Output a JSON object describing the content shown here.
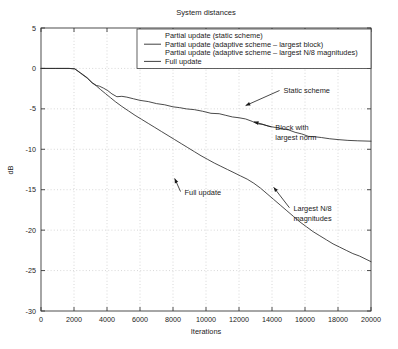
{
  "chart_data": {
    "type": "line",
    "title": "System distances",
    "xlabel": "Iterations",
    "ylabel": "dB",
    "xlim": [
      0,
      20000
    ],
    "ylim": [
      -30,
      5
    ],
    "xticks": [
      0,
      2000,
      4000,
      6000,
      8000,
      10000,
      12000,
      14000,
      16000,
      18000,
      20000
    ],
    "xtick_labels": [
      "0",
      "2000",
      "4000",
      "6000",
      "8000",
      "10000",
      "12000",
      "14000",
      "16000",
      "18000",
      "20000"
    ],
    "yticks": [
      5,
      0,
      -5,
      -10,
      -15,
      -20,
      -25,
      -30
    ],
    "ytick_labels": [
      "5",
      "0",
      "-5",
      "-10",
      "-15",
      "-20",
      "-25",
      "-30"
    ],
    "grid": true,
    "legend_position": "top-center",
    "legend": [
      "Partial update (static scheme)",
      "Partial update (adaptive scheme – largest block)",
      "Partial update (adaptive scheme – largest N/8 magnitudes)",
      "Full update"
    ],
    "annotations": [
      {
        "text": "Static scheme",
        "text_x": 14700,
        "text_y": -3.1,
        "tip_x": 12400,
        "tip_y": -4.6
      },
      {
        "text": "Block with",
        "text_x": 14200,
        "text_y": -7.6,
        "tip_x": 12900,
        "tip_y": -6.6
      },
      {
        "text": "largest norm",
        "text_x": 14200,
        "text_y": -8.9,
        "tip_x": null,
        "tip_y": null
      },
      {
        "text": "Full update",
        "text_x": 8700,
        "text_y": -15.6,
        "tip_x": 8100,
        "tip_y": -13.6
      },
      {
        "text": "Largest N/8",
        "text_x": 15300,
        "text_y": -17.6,
        "tip_x": 14100,
        "tip_y": -14.7
      },
      {
        "text": "magnitudes",
        "text_x": 15300,
        "text_y": -18.9,
        "tip_x": null,
        "tip_y": null
      }
    ],
    "series": [
      {
        "name": "Partial update (static scheme)",
        "points": [
          [
            0,
            0.0
          ],
          [
            900,
            0.0
          ],
          [
            1700,
            0.0
          ],
          [
            2050,
            -0.05
          ],
          [
            2400,
            -0.55
          ],
          [
            2800,
            -1.15
          ],
          [
            3100,
            -1.75
          ],
          [
            3350,
            -2.1
          ],
          [
            3550,
            -2.2
          ],
          [
            3800,
            -2.45
          ],
          [
            4050,
            -2.75
          ],
          [
            4300,
            -3.15
          ],
          [
            4600,
            -3.5
          ],
          [
            4900,
            -3.45
          ],
          [
            5200,
            -3.55
          ],
          [
            5600,
            -3.75
          ],
          [
            6000,
            -3.95
          ],
          [
            6500,
            -4.1
          ],
          [
            7000,
            -4.35
          ],
          [
            7500,
            -4.5
          ],
          [
            8000,
            -4.75
          ],
          [
            8400,
            -4.85
          ],
          [
            8800,
            -5.0
          ],
          [
            9300,
            -5.1
          ],
          [
            9800,
            -5.3
          ],
          [
            10300,
            -5.55
          ],
          [
            10800,
            -5.6
          ],
          [
            11200,
            -5.8
          ],
          [
            11600,
            -6.0
          ],
          [
            12000,
            -6.1
          ],
          [
            12400,
            -6.25
          ],
          [
            12800,
            -6.55
          ],
          [
            13100,
            -6.85
          ],
          [
            13400,
            -6.9
          ],
          [
            13800,
            -7.15
          ],
          [
            14200,
            -7.3
          ],
          [
            14600,
            -7.45
          ],
          [
            15000,
            -7.6
          ],
          [
            15400,
            -7.9
          ],
          [
            15800,
            -8.1
          ],
          [
            16200,
            -8.4
          ],
          [
            16600,
            -8.45
          ],
          [
            17000,
            -8.55
          ],
          [
            17500,
            -8.7
          ],
          [
            18000,
            -8.8
          ],
          [
            18600,
            -8.9
          ],
          [
            19200,
            -8.95
          ],
          [
            20000,
            -9.0
          ]
        ]
      },
      {
        "name": "Full update / largest N/8 magnitudes",
        "points": [
          [
            0,
            0.0
          ],
          [
            900,
            0.0
          ],
          [
            1700,
            0.0
          ],
          [
            2050,
            -0.05
          ],
          [
            2400,
            -0.6
          ],
          [
            2800,
            -1.2
          ],
          [
            3100,
            -1.8
          ],
          [
            3350,
            -2.15
          ],
          [
            3600,
            -2.6
          ],
          [
            3900,
            -3.1
          ],
          [
            4200,
            -3.6
          ],
          [
            4500,
            -4.1
          ],
          [
            4900,
            -4.7
          ],
          [
            5300,
            -5.25
          ],
          [
            5700,
            -5.8
          ],
          [
            6100,
            -6.3
          ],
          [
            6500,
            -6.8
          ],
          [
            6900,
            -7.3
          ],
          [
            7300,
            -7.8
          ],
          [
            7700,
            -8.3
          ],
          [
            8100,
            -8.8
          ],
          [
            8500,
            -9.3
          ],
          [
            8900,
            -9.8
          ],
          [
            9300,
            -10.3
          ],
          [
            9700,
            -10.8
          ],
          [
            10100,
            -11.25
          ],
          [
            10500,
            -11.7
          ],
          [
            10900,
            -12.1
          ],
          [
            11300,
            -12.5
          ],
          [
            11700,
            -12.9
          ],
          [
            12100,
            -13.3
          ],
          [
            12500,
            -13.7
          ],
          [
            12900,
            -14.2
          ],
          [
            13300,
            -14.8
          ],
          [
            13700,
            -15.5
          ],
          [
            14100,
            -16.2
          ],
          [
            14500,
            -16.9
          ],
          [
            14900,
            -17.6
          ],
          [
            15300,
            -18.3
          ],
          [
            15700,
            -19.0
          ],
          [
            16100,
            -19.6
          ],
          [
            16500,
            -20.2
          ],
          [
            16900,
            -20.7
          ],
          [
            17300,
            -21.2
          ],
          [
            17700,
            -21.7
          ],
          [
            18100,
            -22.1
          ],
          [
            18500,
            -22.5
          ],
          [
            18900,
            -22.9
          ],
          [
            19300,
            -23.2
          ],
          [
            19700,
            -23.6
          ],
          [
            20000,
            -23.9
          ]
        ]
      }
    ]
  }
}
